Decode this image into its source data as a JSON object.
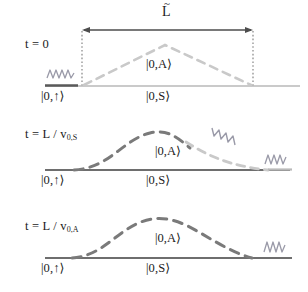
{
  "figure": {
    "title_symbol": "L",
    "title_accent": "~",
    "panels": [
      {
        "id": "panel-t0",
        "time_label": "t = 0",
        "time_sub": "",
        "baseline_label_left": "|0,↑⟩",
        "baseline_label_center": "|0,S⟩",
        "packet_label": "|0,A⟩",
        "photon_positions": [
          "left"
        ]
      },
      {
        "id": "panel-t-vs",
        "time_label": "t = L / v",
        "time_sub": "0,S",
        "baseline_label_left": "|0,↑⟩",
        "baseline_label_center": "|0,S⟩",
        "packet_label": "|0,A⟩",
        "photon_positions": [
          "diagonal",
          "right"
        ]
      },
      {
        "id": "panel-t-va",
        "time_label": "t = L / v",
        "time_sub": "0,A",
        "baseline_label_left": "|0,↑⟩",
        "baseline_label_center": "|0,S⟩",
        "packet_label": "|0,A⟩",
        "photon_positions": [
          "right"
        ]
      }
    ],
    "colors": {
      "ink": "#1a1a1a",
      "baseline_light": "#b9b9b9",
      "baseline_dark": "#6e6e6e",
      "packet_light": "#c9c9c9",
      "packet_dark": "#7a7a7a",
      "photon": "#9a9aa8",
      "dotted_guide": "#7a7a7a",
      "arrow": "#4d4d4d"
    },
    "geometry": {
      "arrow_x_start": 82,
      "arrow_x_end": 253,
      "arrow_y": 30,
      "baseline_y_top": 86,
      "baseline_y_mid": 170,
      "baseline_y_bottom": 258
    }
  }
}
